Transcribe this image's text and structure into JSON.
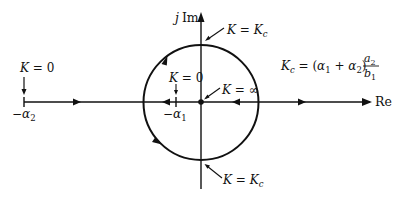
{
  "diagram": {
    "type": "root-locus",
    "axes": {
      "real_label": "Re",
      "imag_label_j": "j",
      "imag_label_im": "Im"
    },
    "points": {
      "minus_alpha2": {
        "sym": "−α",
        "sub": "2"
      },
      "minus_alpha1": {
        "sym": "−α",
        "sub": "1"
      }
    },
    "annotations": {
      "k0_left": {
        "k": "K",
        "rest": " = 0"
      },
      "k0_inner": {
        "k": "K",
        "rest": " = 0"
      },
      "k_inf": {
        "k": "K",
        "rest": " = ∞"
      },
      "kc_top": {
        "k": "K",
        "eq": " = ",
        "kc": "K",
        "kc_sub": "c"
      },
      "kc_bottom": {
        "k": "K",
        "eq": " = ",
        "kc": "K",
        "kc_sub": "c"
      }
    },
    "formula": {
      "lhs": "K",
      "lhs_sub": "c",
      "eq": " = (",
      "a1": "α",
      "a1_sub": "1",
      "plus": " + ",
      "a2": "α",
      "a2_sub": "2",
      "close": ")",
      "num": "a",
      "num_sub": "2",
      "den": "b",
      "den_sub": "1"
    },
    "colors": {
      "stroke": "#111111",
      "background": "#ffffff"
    }
  }
}
